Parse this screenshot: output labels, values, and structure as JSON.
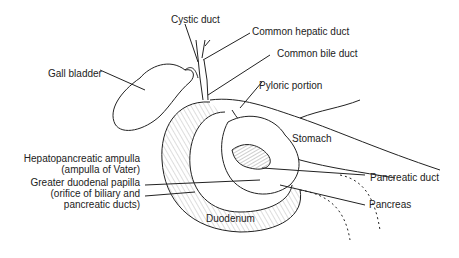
{
  "diagram": {
    "labels": {
      "cystic_duct": "Cystic duct",
      "common_hepatic_duct": "Common hepatic duct",
      "common_bile_duct": "Common bile duct",
      "gall_bladder": "Gall bladder",
      "pyloric_portion": "Pyloric portion",
      "stomach": "Stomach",
      "hepatopancreatic_ampulla_1": "Hepatopancreatic ampulla",
      "hepatopancreatic_ampulla_2": "(ampulla of Vater)",
      "greater_duodenal_papilla_1": "Greater duodenal papilla",
      "greater_duodenal_papilla_2": "(orifice of biliary and",
      "greater_duodenal_papilla_3": "pancreatic ducts)",
      "pancreatic_duct": "Pancreatic duct",
      "pancreas": "Pancreas",
      "duodenum": "Duodenum"
    },
    "colors": {
      "ink": "#222222",
      "background": "#ffffff"
    }
  }
}
